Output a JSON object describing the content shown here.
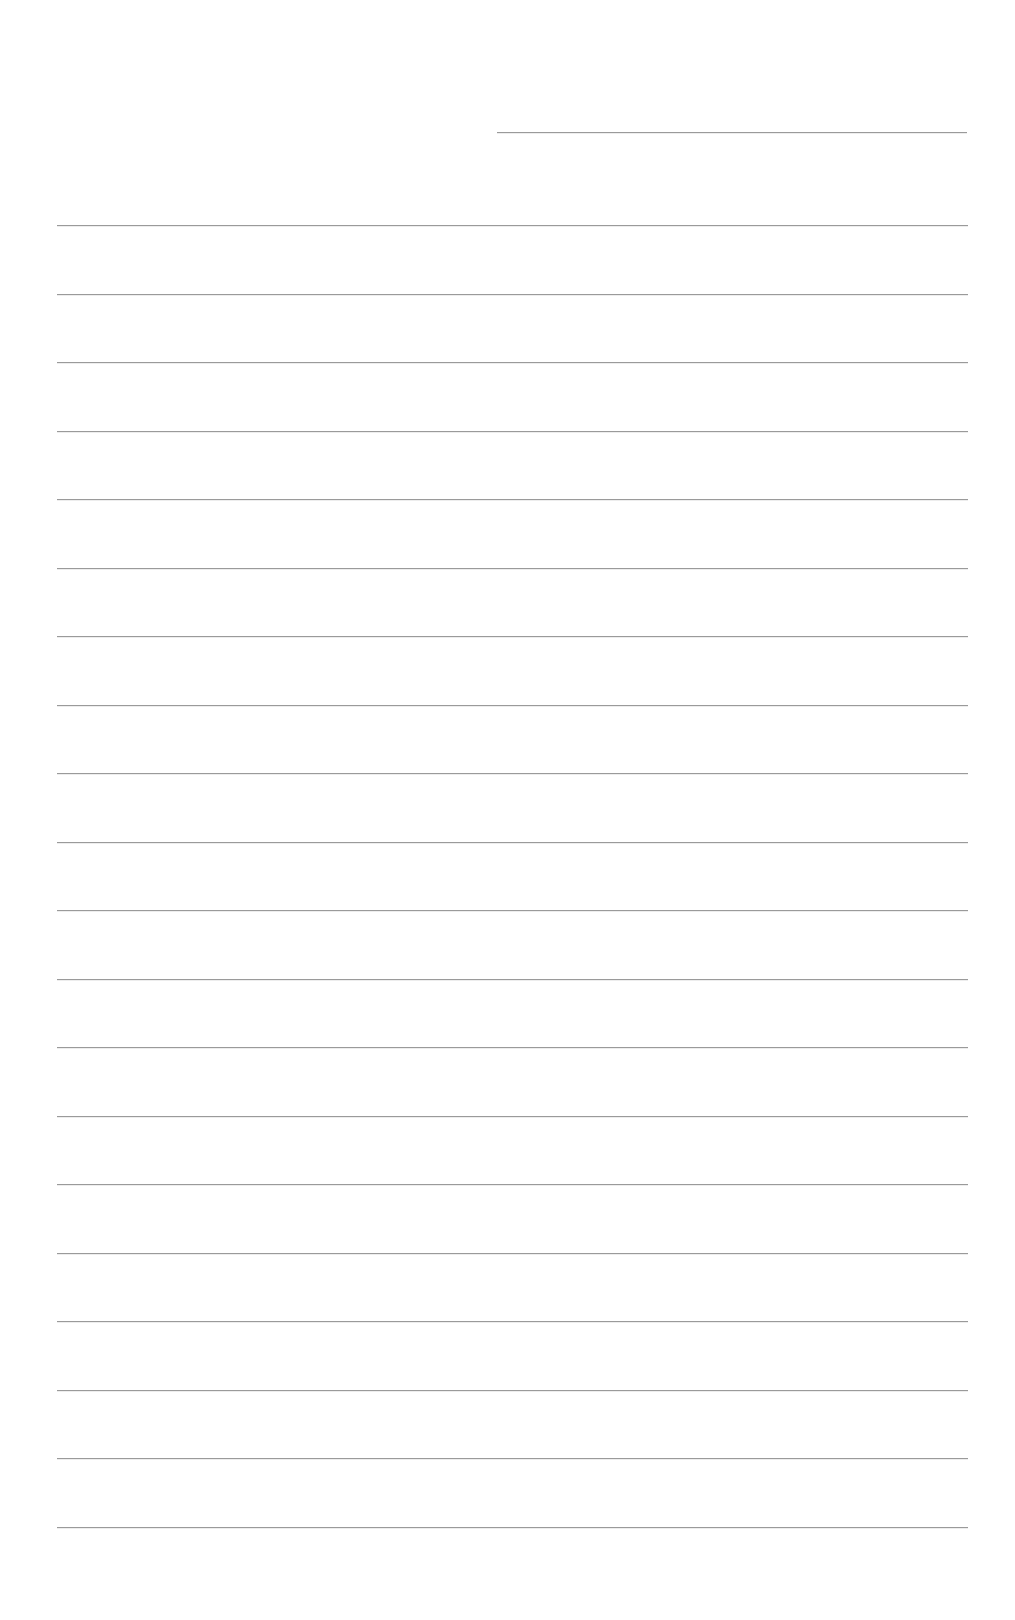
{
  "page": {
    "type": "blank lined paper",
    "background_color": "#ffffff",
    "line_color": "#9a9a9a"
  },
  "header_line": {
    "label": "",
    "y": 132,
    "x_start": 497,
    "x_end": 967
  },
  "writing_lines": {
    "count": 20,
    "first_y": 225,
    "spacing": 68.5,
    "x_start": 57,
    "x_end": 968,
    "items": [
      {
        "index": 1,
        "text": ""
      },
      {
        "index": 2,
        "text": ""
      },
      {
        "index": 3,
        "text": ""
      },
      {
        "index": 4,
        "text": ""
      },
      {
        "index": 5,
        "text": ""
      },
      {
        "index": 6,
        "text": ""
      },
      {
        "index": 7,
        "text": ""
      },
      {
        "index": 8,
        "text": ""
      },
      {
        "index": 9,
        "text": ""
      },
      {
        "index": 10,
        "text": ""
      },
      {
        "index": 11,
        "text": ""
      },
      {
        "index": 12,
        "text": ""
      },
      {
        "index": 13,
        "text": ""
      },
      {
        "index": 14,
        "text": ""
      },
      {
        "index": 15,
        "text": ""
      },
      {
        "index": 16,
        "text": ""
      },
      {
        "index": 17,
        "text": ""
      },
      {
        "index": 18,
        "text": ""
      },
      {
        "index": 19,
        "text": ""
      },
      {
        "index": 20,
        "text": ""
      }
    ]
  }
}
